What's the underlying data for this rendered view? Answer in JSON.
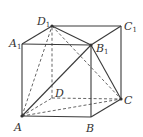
{
  "diagram": {
    "type": "cube",
    "vertices": [
      {
        "id": "A",
        "label": "A",
        "sub": "",
        "x": 22,
        "y": 116,
        "lx": 14,
        "ly": 131
      },
      {
        "id": "B",
        "label": "B",
        "sub": "",
        "x": 91,
        "y": 117,
        "lx": 86,
        "ly": 132
      },
      {
        "id": "C",
        "label": "C",
        "sub": "",
        "x": 121,
        "y": 99,
        "lx": 124,
        "ly": 104
      },
      {
        "id": "D",
        "label": "D",
        "sub": "",
        "x": 52,
        "y": 98,
        "lx": 55,
        "ly": 97
      },
      {
        "id": "A1",
        "label": "A",
        "sub": "1",
        "x": 22,
        "y": 44,
        "lx": 9,
        "ly": 47
      },
      {
        "id": "B1",
        "label": "B",
        "sub": "1",
        "x": 91,
        "y": 45,
        "lx": 96,
        "ly": 52
      },
      {
        "id": "C1",
        "label": "C",
        "sub": "1",
        "x": 121,
        "y": 26,
        "lx": 124,
        "ly": 30
      },
      {
        "id": "D1",
        "label": "D",
        "sub": "1",
        "x": 52,
        "y": 26,
        "lx": 37,
        "ly": 25
      }
    ],
    "solid_edges": [
      [
        "A",
        "B"
      ],
      [
        "B",
        "C"
      ],
      [
        "A",
        "A1"
      ],
      [
        "B",
        "B1"
      ],
      [
        "C",
        "C1"
      ],
      [
        "A1",
        "B1"
      ],
      [
        "B1",
        "C1"
      ],
      [
        "C1",
        "D1"
      ],
      [
        "D1",
        "A1"
      ],
      [
        "A",
        "B1"
      ],
      [
        "D1",
        "B1"
      ],
      [
        "B1",
        "C"
      ]
    ],
    "dashed_edges": [
      [
        "A",
        "D"
      ],
      [
        "D",
        "C"
      ],
      [
        "D",
        "D1"
      ],
      [
        "A",
        "D1"
      ],
      [
        "D1",
        "C"
      ],
      [
        "A",
        "C"
      ]
    ],
    "dots": [
      "A",
      "C",
      "D1",
      "B1"
    ]
  }
}
